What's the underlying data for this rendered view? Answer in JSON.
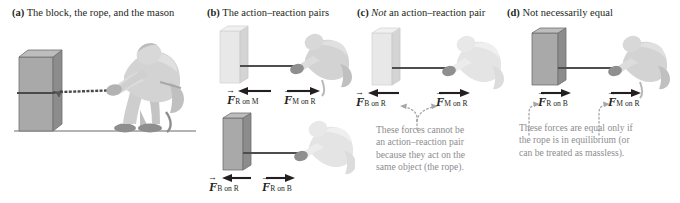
{
  "figure": {
    "panels": [
      {
        "id": "a",
        "letter": "(a)",
        "title": "The block, the rope, and the mason",
        "title_italic_word": "",
        "elements": [
          "block",
          "rope",
          "mason",
          "ground"
        ]
      },
      {
        "id": "b",
        "letter": "(b)",
        "title": "The action–reaction pairs",
        "title_italic_word": "",
        "vectors_top": [
          {
            "label_F": "F",
            "subscript": "R on M",
            "direction": "left"
          },
          {
            "label_F": "F",
            "subscript": "M on R",
            "direction": "right"
          }
        ],
        "vectors_bottom": [
          {
            "label_F": "F",
            "subscript": "B on R",
            "direction": "left"
          },
          {
            "label_F": "F",
            "subscript": "R on B",
            "direction": "right"
          }
        ]
      },
      {
        "id": "c",
        "letter": "(c)",
        "title_italic_word": "Not",
        "title": " an action–reaction pair",
        "vectors": [
          {
            "label_F": "F",
            "subscript": "B on R",
            "direction": "left"
          },
          {
            "label_F": "F",
            "subscript": "M on R",
            "direction": "right"
          }
        ],
        "caption": "These forces cannot be\nan action–reaction pair\nbecause they act on the\nsame object (the rope)."
      },
      {
        "id": "d",
        "letter": "(d)",
        "title": "Not necessarily equal",
        "title_italic_word": "",
        "vectors": [
          {
            "label_F": "F",
            "subscript": "R on B",
            "direction": "right"
          },
          {
            "label_F": "F",
            "subscript": "M on R",
            "direction": "right"
          }
        ],
        "caption": "These forces are equal only if\nthe rope is in equilibrium (or\ncan be treated as massless)."
      }
    ],
    "colors": {
      "text": "#231f20",
      "caption_gray": "#8d8d8f",
      "block_dark_front": "#a9a9a9",
      "block_dark_side": "#8f8f8f",
      "block_faded_front": "#e3e3e3",
      "block_faded_side": "#cfcfcf",
      "figure_gray": "#c9c9c9",
      "figure_faded": "#e6e6e6",
      "rope_dark": "#4d4d4d",
      "rope_faded": "#cdcdcd",
      "arrow": "#231f20",
      "dotted_gray": "#a6a6a6",
      "ground": "#9b9b9b"
    }
  }
}
